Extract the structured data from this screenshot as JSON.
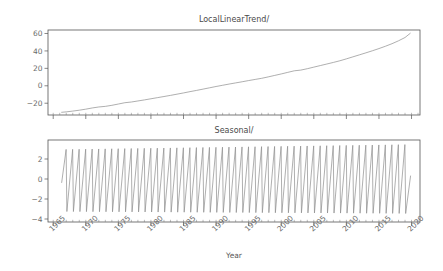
{
  "figure": {
    "width": 443,
    "height": 271,
    "background": "#ffffff",
    "line_color": "#8c8c8c",
    "axis_color": "#555555",
    "text_color": "#6b6b6b"
  },
  "chart_data": [
    {
      "type": "line",
      "title": "LocalLinearTrend/",
      "xlabel": "",
      "ylabel": "",
      "grid": false,
      "legend": null,
      "xlim": [
        1964.2,
        2021.3
      ],
      "ylim": [
        -33.5,
        64.0
      ],
      "yticks": [
        -20,
        0,
        20,
        40,
        60
      ],
      "ytick_labels": [
        "−20",
        "0",
        "20",
        "40",
        "60"
      ],
      "xticks": [
        1965,
        1970,
        1975,
        1980,
        1985,
        1990,
        1995,
        2000,
        2005,
        2010,
        2015,
        2020
      ],
      "xtick_labels": [
        "1965",
        "1970",
        "1975",
        "1980",
        "1985",
        "1990",
        "1995",
        "2000",
        "2005",
        "2010",
        "2015",
        "2020"
      ],
      "xtick_labels_visible": false,
      "x": [
        1966.3,
        1967.0,
        1968.0,
        1969.0,
        1970.0,
        1971.0,
        1972.0,
        1973.0,
        1974.0,
        1975.0,
        1976.0,
        1977.0,
        1978.0,
        1979.0,
        1980.0,
        1981.0,
        1982.0,
        1983.0,
        1984.0,
        1985.0,
        1986.0,
        1987.0,
        1988.0,
        1989.0,
        1990.0,
        1991.0,
        1992.0,
        1993.0,
        1994.0,
        1995.0,
        1996.0,
        1997.0,
        1998.0,
        1999.0,
        2000.0,
        2001.0,
        2002.0,
        2003.0,
        2004.0,
        2005.0,
        2006.0,
        2007.0,
        2008.0,
        2009.0,
        2010.0,
        2011.0,
        2012.0,
        2013.0,
        2014.0,
        2015.0,
        2016.0,
        2017.0,
        2018.0,
        2019.0,
        2019.8
      ],
      "values": [
        -30.4,
        -29.9,
        -29.0,
        -28.0,
        -26.8,
        -25.4,
        -24.3,
        -23.6,
        -22.4,
        -20.9,
        -19.4,
        -18.6,
        -17.4,
        -16.2,
        -14.9,
        -13.6,
        -12.3,
        -11.0,
        -9.6,
        -8.2,
        -6.7,
        -5.3,
        -3.8,
        -2.3,
        -0.8,
        0.6,
        2.0,
        3.3,
        4.6,
        6.0,
        7.3,
        8.6,
        10.2,
        11.9,
        13.6,
        15.4,
        17.2,
        18.0,
        19.6,
        21.4,
        23.2,
        25.0,
        26.8,
        28.7,
        30.9,
        33.2,
        35.5,
        37.8,
        40.2,
        42.7,
        45.4,
        48.3,
        51.6,
        55.4,
        60.2
      ]
    },
    {
      "type": "line",
      "title": "Seasonal/",
      "xlabel": "Year",
      "ylabel": "",
      "grid": false,
      "legend": null,
      "xlim": [
        1964.2,
        2021.3
      ],
      "ylim": [
        -4.3,
        3.9
      ],
      "yticks": [
        -4,
        -2,
        0,
        2
      ],
      "ytick_labels": [
        "−4",
        "−2",
        "0",
        "2"
      ],
      "xticks": [
        1965,
        1970,
        1975,
        1980,
        1985,
        1990,
        1995,
        2000,
        2005,
        2010,
        2015,
        2020
      ],
      "xtick_labels": [
        "1965",
        "1970",
        "1975",
        "1980",
        "1985",
        "1990",
        "1995",
        "2000",
        "2005",
        "2010",
        "2015",
        "2020"
      ],
      "xtick_label_rotation": -45,
      "description": "sawtooth seasonal component, one cycle per year, rising ramp then sharp drop",
      "series_start_year": 1966.3,
      "series_end_year": 2019.85,
      "cycle_period_years": 1.0,
      "peak_start": 2.95,
      "peak_end": 3.45,
      "trough_start": -3.25,
      "trough_end": -3.45,
      "first_value": -0.35
    }
  ]
}
